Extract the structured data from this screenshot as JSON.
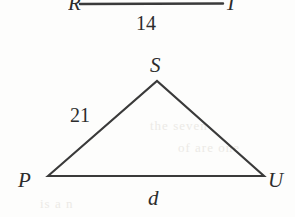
{
  "figure": {
    "kind": "geometry-diagram",
    "background_color": "#fdfdfc",
    "stroke_color": "#3a3a3a",
    "text_color": "#2c2c2c",
    "upper_figure": {
      "description": "partially cropped segment with endpoints R and T",
      "left_vertex_label": "R",
      "right_vertex_label": "T",
      "side_length_label": "14"
    },
    "triangle": {
      "name": "PSU",
      "apex_label": "S",
      "left_vertex_label": "P",
      "right_vertex_label": "U",
      "left_side_label": "21",
      "base_label": "d"
    },
    "ghost_marks": [
      "the  seven",
      "of  are  one",
      "is  a  n"
    ]
  }
}
